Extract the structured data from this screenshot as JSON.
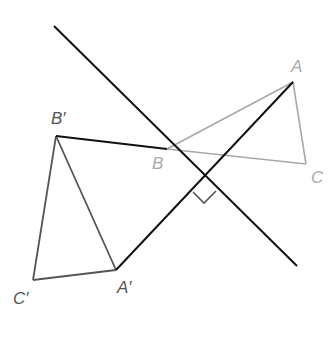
{
  "diagram": {
    "colors": {
      "original": "#a8a8a8",
      "image": "#555555",
      "construction": "#111111",
      "label_original": "#aaaaaa",
      "label_image": "#555555"
    },
    "points": {
      "A": {
        "label": "A",
        "x": 293,
        "y": 82
      },
      "B": {
        "label": "B",
        "x": 167,
        "y": 149
      },
      "C": {
        "label": "C",
        "x": 306,
        "y": 164
      },
      "A_prime": {
        "label": "A′",
        "x": 116,
        "y": 270
      },
      "B_prime": {
        "label": "B′",
        "x": 56,
        "y": 136
      },
      "C_prime": {
        "label": "C′",
        "x": 33,
        "y": 280
      }
    },
    "mirror_line": {
      "x1": 54,
      "y1": 26,
      "x2": 297,
      "y2": 266
    },
    "right_angle_marker": "perpendicular"
  }
}
